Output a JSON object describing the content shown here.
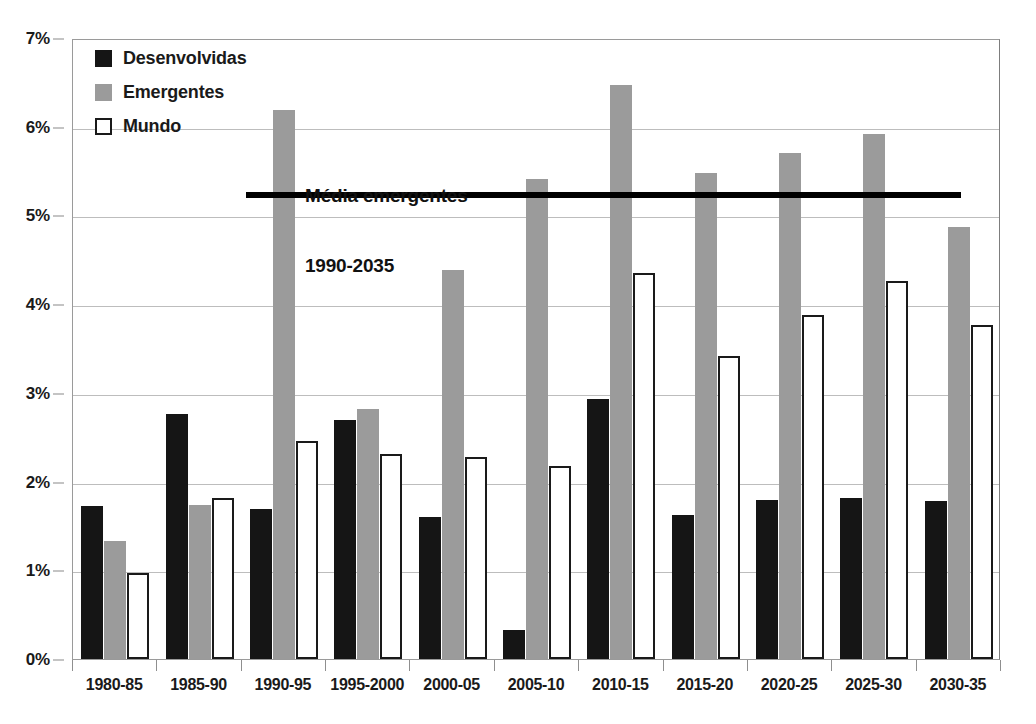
{
  "chart_data": {
    "type": "bar",
    "title": "",
    "xlabel": "",
    "ylabel": "",
    "ylim": [
      0,
      7
    ],
    "y_tick_labels": [
      "0%",
      "1%",
      "2%",
      "3%",
      "4%",
      "5%",
      "6%",
      "7%"
    ],
    "y_tick_values": [
      0,
      1,
      2,
      3,
      4,
      5,
      6,
      7
    ],
    "grid": true,
    "legend_position": "top-left",
    "categories": [
      "1980-85",
      "1985-90",
      "1990-95",
      "1995-2000",
      "2000-05",
      "2005-10",
      "2010-15",
      "2015-20",
      "2020-25",
      "2025-30",
      "2030-35"
    ],
    "series": [
      {
        "name": "Desenvolvidas",
        "color": "#151515",
        "values": [
          1.72,
          2.76,
          1.69,
          2.69,
          1.6,
          0.33,
          2.93,
          1.62,
          1.79,
          1.82,
          1.78
        ]
      },
      {
        "name": "Emergentes",
        "color": "#9b9b9b",
        "values": [
          1.33,
          1.74,
          6.19,
          2.82,
          4.39,
          5.41,
          6.47,
          5.48,
          5.7,
          5.92,
          4.87
        ]
      },
      {
        "name": "Mundo",
        "color": "#ffffff",
        "values": [
          0.97,
          1.81,
          2.46,
          2.31,
          2.28,
          2.18,
          4.35,
          3.41,
          3.88,
          4.26,
          3.76
        ]
      }
    ],
    "annotations": [
      {
        "name": "average-emerging-line",
        "text_line_1": "Média emergentes",
        "text_line_2": "1990-2035",
        "value": 5.25,
        "span_categories": [
          "1990-95",
          "2030-35"
        ]
      }
    ]
  },
  "legend": {
    "items": [
      {
        "label": "Desenvolvidas",
        "swatch": "filled-black-square"
      },
      {
        "label": "Emergentes",
        "swatch": "filled-gray-square"
      },
      {
        "label": "Mundo",
        "swatch": "outlined-white-square"
      }
    ]
  },
  "colors": {
    "developed": "#151515",
    "emerging": "#9b9b9b",
    "world": "#ffffff",
    "outline": "#1a1a1a",
    "gridline": "#bdbdbd",
    "average_line": "#000000"
  }
}
